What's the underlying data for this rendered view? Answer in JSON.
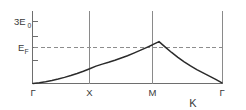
{
  "chart_data": {
    "type": "line",
    "title": "",
    "subtitle": "",
    "xlabel": "K",
    "ylabel": "",
    "grid": false,
    "legend": null,
    "x_tick_labels": [
      "Γ",
      "X",
      "M",
      "Γ"
    ],
    "x_tick_positions": [
      0,
      1,
      2,
      3
    ],
    "xlim": [
      0,
      3
    ],
    "y_tick_labels": [
      "3E",
      "E"
    ],
    "y_tick_subscripts": [
      "0",
      "F"
    ],
    "y_tick_values": [
      3.0,
      1.55
    ],
    "ylim": [
      0,
      3.55
    ],
    "annotations": [
      {
        "name": "fermi-level-dashed-line",
        "label": "E_F",
        "value": 1.55,
        "style": "dashed-horizontal"
      }
    ],
    "series": [
      {
        "name": "band-dispersion",
        "x": [
          0.0,
          0.1,
          0.2,
          0.3,
          0.4,
          0.5,
          0.6,
          0.7,
          0.8,
          0.9,
          1.0,
          1.1,
          1.2,
          1.3,
          1.4,
          1.5,
          1.6,
          1.7,
          1.8,
          1.9,
          2.0,
          2.1,
          2.2,
          2.3,
          2.4,
          2.5,
          2.6,
          2.7,
          2.8,
          2.9,
          3.0
        ],
        "y": [
          0.0,
          0.04,
          0.09,
          0.15,
          0.22,
          0.3,
          0.39,
          0.49,
          0.6,
          0.72,
          0.85,
          0.95,
          1.04,
          1.14,
          1.25,
          1.36,
          1.49,
          1.62,
          1.76,
          1.9,
          2.05,
          1.78,
          1.52,
          1.28,
          1.06,
          0.86,
          0.68,
          0.52,
          0.36,
          0.2,
          0.03
        ]
      }
    ],
    "vertical_symmetry_lines": [
      {
        "name": "gamma-left-boundary",
        "x": 0
      },
      {
        "name": "x-point-line",
        "x": 1
      },
      {
        "name": "m-point-line",
        "x": 2
      },
      {
        "name": "gamma-right-boundary",
        "x": 3
      }
    ]
  },
  "labels": {
    "y_upper_main": "3E",
    "y_upper_sub": "0",
    "y_fermi_main": "E",
    "y_fermi_sub": "F",
    "x_gamma_left": "Γ",
    "x_point": "X",
    "m_point": "M",
    "x_gamma_right": "Γ",
    "x_axis_title": "K"
  },
  "colors": {
    "background": "#ffffff",
    "axis": "#6e6e6e",
    "vertical_line": "#8a8a8a",
    "curve": "#2b2b2b",
    "fermi_dash": "#8d8d8d",
    "text": "#3a3a3a"
  }
}
